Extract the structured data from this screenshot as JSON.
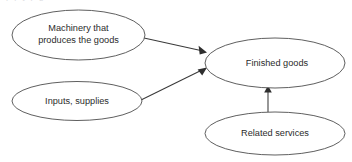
{
  "canvas": {
    "width": 352,
    "height": 162,
    "background": "#ffffff"
  },
  "page_artifact": {
    "clipped_text_top": "p    p   y     p          g"
  },
  "theme": {
    "node_stroke": "#4d4d4d",
    "node_fill": "#ffffff",
    "text_color": "#2b2b2b",
    "edge_color": "#3a3a3a"
  },
  "diagram": {
    "type": "flowchart",
    "title": "",
    "nodes": [
      {
        "id": "machinery",
        "shape": "ellipse",
        "lines": [
          "Machinery that",
          "produces the goods"
        ],
        "label": "Machinery that produces the goods",
        "cx": 78.5,
        "cy": 35,
        "rx": 66.5,
        "ry": 25
      },
      {
        "id": "inputs",
        "shape": "ellipse",
        "lines": [
          "Inputs, supplies"
        ],
        "label": "Inputs, supplies",
        "cx": 77,
        "cy": 101,
        "rx": 65,
        "ry": 19.5
      },
      {
        "id": "finished",
        "shape": "ellipse",
        "lines": [
          "Finished goods"
        ],
        "label": "Finished goods",
        "cx": 275,
        "cy": 63,
        "rx": 70,
        "ry": 25
      },
      {
        "id": "services",
        "shape": "ellipse",
        "lines": [
          "Related services"
        ],
        "label": "Related services",
        "cx": 275,
        "cy": 133.5,
        "rx": 70,
        "ry": 21.5
      }
    ],
    "edges": [
      {
        "id": "machinery-to-finished",
        "from": "machinery",
        "to": "finished",
        "x1": 144,
        "y1": 38,
        "x2": 206,
        "y2": 52,
        "arrowhead": "filled-triangle"
      },
      {
        "id": "inputs-to-finished",
        "from": "inputs",
        "to": "finished",
        "x1": 141,
        "y1": 100,
        "x2": 206,
        "y2": 68,
        "arrowhead": "filled-triangle"
      },
      {
        "id": "services-to-finished",
        "from": "services",
        "to": "finished",
        "x1": 268,
        "y1": 112,
        "x2": 268,
        "y2": 87,
        "arrowhead": "filled-triangle"
      }
    ]
  }
}
